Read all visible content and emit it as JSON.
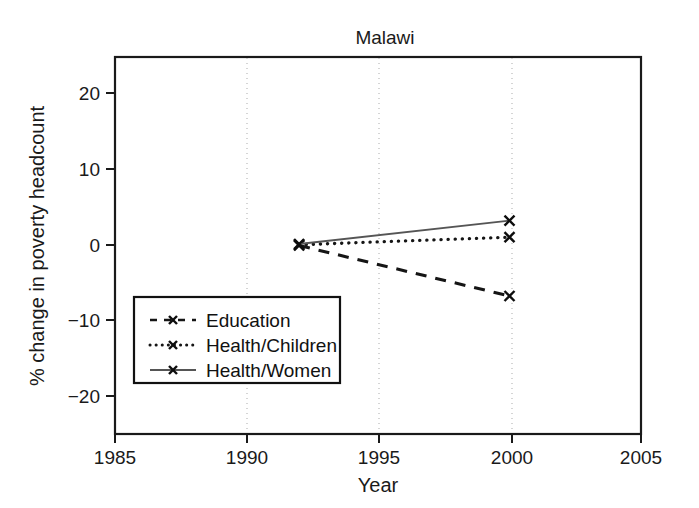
{
  "chart_data": {
    "type": "line",
    "title": "Malawi",
    "xlabel": "Year",
    "ylabel": "% change in poverty headcount",
    "xlim": [
      1985,
      2005
    ],
    "ylim": [
      -25,
      25
    ],
    "xticks": [
      1985,
      1990,
      1995,
      2000,
      2005
    ],
    "xtick_labels": [
      "1985",
      "1990",
      "1995",
      "2000",
      "2005"
    ],
    "yticks": [
      -20,
      -10,
      0,
      10,
      20
    ],
    "ytick_labels": [
      "−20",
      "−10",
      "0",
      "10",
      "20"
    ],
    "grid": "vertical-dotted-at-1990-1995-2000",
    "legend_position": "lower-left-inside",
    "x": [
      1992,
      2000
    ],
    "series": [
      {
        "name": "Education",
        "style": "dashed",
        "marker": "x",
        "values": [
          0.0,
          -6.7
        ]
      },
      {
        "name": "Health/Children",
        "style": "dotted",
        "marker": "x",
        "values": [
          0.1,
          1.1
        ]
      },
      {
        "name": "Health/Women",
        "style": "solid",
        "marker": "x",
        "values": [
          0.2,
          3.3
        ]
      }
    ]
  },
  "legend": {
    "entries": [
      {
        "label": "Education",
        "style": "dashed",
        "marker": "x"
      },
      {
        "label": "Health/Children",
        "style": "dotted",
        "marker": "x"
      },
      {
        "label": "Health/Women",
        "style": "solid",
        "marker": "x"
      }
    ]
  },
  "colors": {
    "background": "#ffffff",
    "axis": "#1a1a1a",
    "text": "#1a1a1a",
    "gridline": "#b9b9b9",
    "education": "#151515",
    "health_children": "#151515",
    "health_women": "#555555"
  }
}
